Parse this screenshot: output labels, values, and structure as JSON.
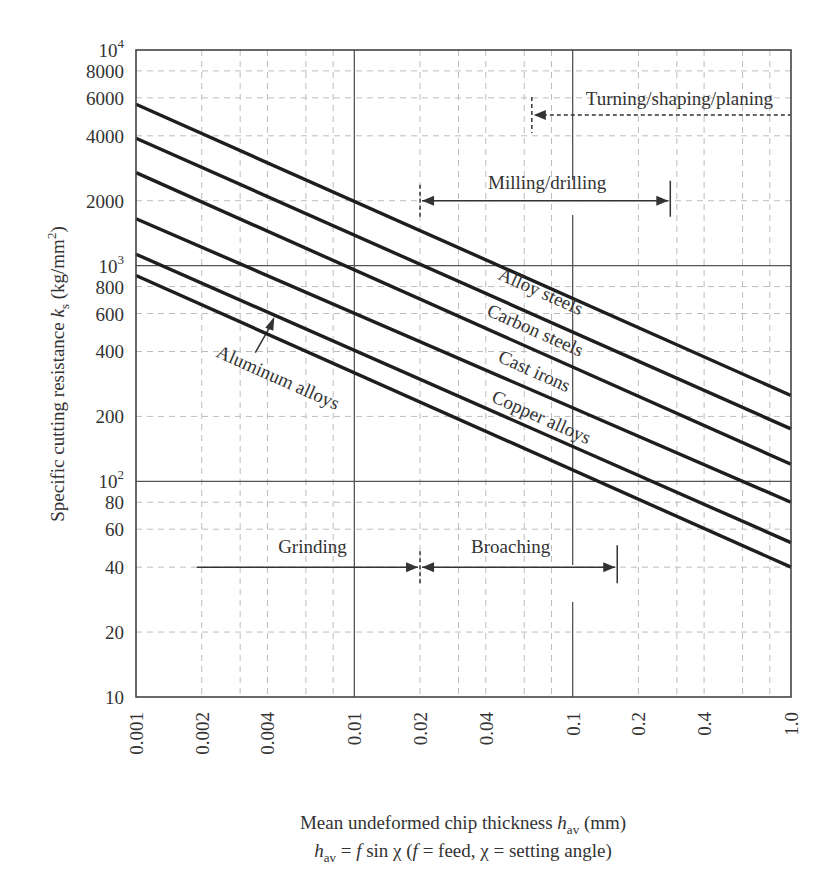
{
  "chart_data": {
    "type": "line",
    "title": "",
    "xscale": "log",
    "yscale": "log",
    "xlabel": "Mean undeformed chip thickness h_av (mm)",
    "xlabel_parts": {
      "main": "Mean undeformed chip thickness ",
      "var": "h",
      "sub": "av",
      "unit": " (mm)"
    },
    "xlabel_line2": "h_av = f sin χ (f = feed, χ = setting angle)",
    "xlabel_line2_parts": {
      "var": "h",
      "sub": "av",
      "eq": " = ",
      "f": "f",
      "rest1": " sin χ (",
      "f2": "f",
      "rest2": " = feed, χ = setting angle)"
    },
    "ylabel": "Specific cutting resistance k_s (kg/mm²)",
    "ylabel_parts": {
      "main": "Specific cutting resistance ",
      "var": "k",
      "sub": "s",
      "unit": " (kg/mm",
      "sup": "2",
      "close": ")"
    },
    "xlim": [
      0.001,
      1.0
    ],
    "ylim": [
      10,
      10000
    ],
    "x_ticks": [
      "0.001",
      "0.002",
      "0.004",
      "0.01",
      "0.02",
      "0.04",
      "0.1",
      "0.2",
      "0.4",
      "1.0"
    ],
    "x_tick_values": [
      0.001,
      0.002,
      0.004,
      0.01,
      0.02,
      0.04,
      0.1,
      0.2,
      0.4,
      1.0
    ],
    "y_ticks": [
      {
        "value": 10000,
        "base": "10",
        "exp": "4"
      },
      {
        "value": 8000,
        "label": "8000"
      },
      {
        "value": 6000,
        "label": "6000"
      },
      {
        "value": 4000,
        "label": "4000"
      },
      {
        "value": 2000,
        "label": "2000"
      },
      {
        "value": 1000,
        "base": "10",
        "exp": "3"
      },
      {
        "value": 800,
        "label": "800"
      },
      {
        "value": 600,
        "label": "600"
      },
      {
        "value": 400,
        "label": "400"
      },
      {
        "value": 200,
        "label": "200"
      },
      {
        "value": 100,
        "base": "10",
        "exp": "2"
      },
      {
        "value": 80,
        "label": "80"
      },
      {
        "value": 60,
        "label": "60"
      },
      {
        "value": 40,
        "label": "40"
      },
      {
        "value": 20,
        "label": "20"
      },
      {
        "value": 10,
        "label": "10"
      }
    ],
    "grid": {
      "major_x": [
        0.01,
        0.1
      ],
      "major_y": [
        100,
        1000
      ],
      "minor_x": [
        0.002,
        0.003,
        0.004,
        0.006,
        0.008,
        0.02,
        0.03,
        0.04,
        0.06,
        0.08,
        0.2,
        0.3,
        0.4,
        0.6,
        0.8
      ],
      "minor_y": [
        20,
        40,
        60,
        80,
        200,
        400,
        600,
        800,
        2000,
        4000,
        6000,
        8000
      ]
    },
    "x": [
      0.001,
      1.0
    ],
    "series": [
      {
        "name": "Alloy steels",
        "values": [
          5600,
          250
        ]
      },
      {
        "name": "Carbon steels",
        "values": [
          3900,
          175
        ]
      },
      {
        "name": "Cast irons",
        "values": [
          2700,
          120
        ]
      },
      {
        "name": "Copper alloys",
        "values": [
          1650,
          80
        ]
      },
      {
        "name": "Unlabeled",
        "values": [
          1130,
          52
        ]
      },
      {
        "name": "Aluminum alloys",
        "values": [
          900,
          40
        ]
      }
    ],
    "series_labels": [
      {
        "text": "Alloy steels",
        "x": 0.045,
        "y": 870,
        "rotate": 24
      },
      {
        "text": "Carbon steels",
        "x": 0.04,
        "y": 590,
        "rotate": 24
      },
      {
        "text": "Cast irons",
        "x": 0.045,
        "y": 360,
        "rotate": 24
      },
      {
        "text": "Copper alloys",
        "x": 0.042,
        "y": 235,
        "rotate": 24
      },
      {
        "text": "Aluminum alloys",
        "x": 0.0023,
        "y": 380,
        "rotate": 24
      }
    ],
    "annotations": [
      {
        "text": "Turning/shaping/planing",
        "type": "left-arrow-dotted",
        "from": 0.065,
        "to": 1.0,
        "y": 5000
      },
      {
        "text": "Milling/drilling",
        "type": "double-arrow",
        "from": 0.02,
        "to": 0.28,
        "y": 2000
      },
      {
        "text": "Grinding",
        "type": "right-arrow",
        "from": 0.0019,
        "to": 0.02,
        "y": 40
      },
      {
        "text": "Broaching",
        "type": "double-arrow",
        "from": 0.02,
        "to": 0.16,
        "y": 40
      },
      {
        "text": "Aluminum alloys",
        "type": "pointer-arrow",
        "target_x": 0.0043,
        "target_y": 580
      }
    ]
  },
  "labels": {
    "turning": "Turning/shaping/planing",
    "milling": "Milling/drilling",
    "grinding": "Grinding",
    "broaching": "Broaching",
    "alloy_steels": "Alloy steels",
    "carbon_steels": "Carbon steels",
    "cast_irons": "Cast irons",
    "copper_alloys": "Copper alloys",
    "aluminum_alloys": "Aluminum alloys"
  },
  "colors": {
    "line": "#1e1e1e",
    "text": "#333333",
    "grid_major": "#555555",
    "grid_minor": "#bdbdbd",
    "background": "#ffffff"
  }
}
